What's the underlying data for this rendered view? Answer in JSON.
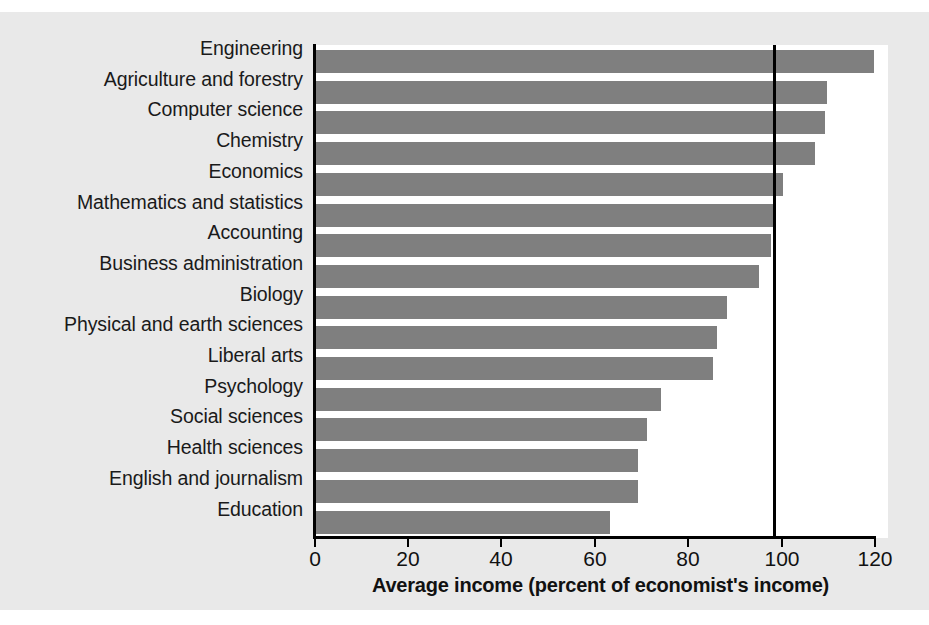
{
  "chart_data": {
    "type": "bar",
    "orientation": "horizontal",
    "title": "",
    "xlabel": "Average income (percent of economist's income)",
    "ylabel": "",
    "xlim": [
      0,
      120
    ],
    "xticks": [
      0,
      20,
      40,
      60,
      80,
      100,
      120
    ],
    "xtick_labels": [
      "0",
      "20",
      "40",
      "60",
      "80",
      "100",
      "120"
    ],
    "grid": false,
    "legend": null,
    "reference_line": {
      "value": 100,
      "orientation": "vertical",
      "color": "#000000"
    },
    "bar_color": "#7f7f7f",
    "background_color": "#e9e9e9",
    "plot_background_color": "#ffffff",
    "categories": [
      "Engineering",
      "Agriculture and forestry",
      "Computer science",
      "Chemistry",
      "Economics",
      "Mathematics and statistics",
      "Accounting",
      "Business administration",
      "Biology",
      "Physical and earth sciences",
      "Liberal arts",
      "Psychology",
      "Social sciences",
      "Health sciences",
      "English and journalism",
      "Education"
    ],
    "values": [
      119.5,
      109.5,
      109,
      107,
      100,
      98.5,
      97.5,
      95,
      88,
      86,
      85,
      74,
      71,
      69,
      69,
      63
    ]
  }
}
